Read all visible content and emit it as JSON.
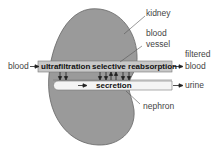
{
  "labels": {
    "kidney": "kidney",
    "blood_vessel_line1": "blood",
    "blood_vessel_line2": "vessel",
    "blood_in": "blood",
    "filtered_line1": "filtered",
    "filtered_line2": "blood",
    "urine": "urine",
    "nephron": "nephron"
  },
  "processes": {
    "ultrafiltration": "ultrafiltration",
    "selective_reabsorption": "selective reabsorption",
    "secretion": "secretion"
  },
  "colors": {
    "kidney": "#9a9a9a",
    "vessel": "#c8c8c8",
    "nephron": "#f4f4f4"
  }
}
